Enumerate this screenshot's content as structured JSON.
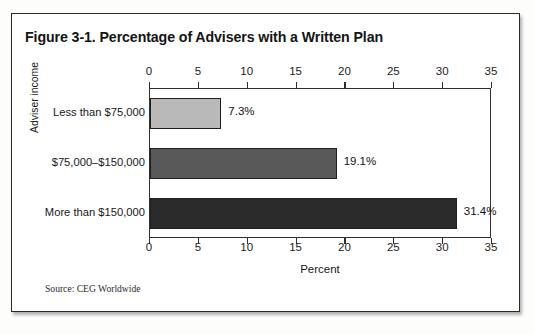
{
  "figure": {
    "title": "Figure 3-1. Percentage of Advisers with a Written Plan",
    "source": "Source: CEG Worldwide"
  },
  "chart_data": {
    "type": "bar",
    "orientation": "horizontal",
    "title": "Figure 3-1. Percentage of Advisers with a Written Plan",
    "categories": [
      "Less than $75,000",
      "$75,000–$150,000",
      "More than $150,000"
    ],
    "values": [
      7.3,
      19.1,
      31.4
    ],
    "value_labels": [
      "7.3%",
      "19.1%",
      "31.4%"
    ],
    "bar_colors": [
      "#b9b9b9",
      "#595959",
      "#2b2b2b"
    ],
    "xlabel": "Percent",
    "ylabel": "Adviser income",
    "xlim": [
      0,
      35
    ],
    "xticks": [
      0,
      5,
      10,
      15,
      20,
      25,
      30,
      35
    ],
    "xtick_labels": [
      "0",
      "5",
      "10",
      "15",
      "20",
      "25",
      "30",
      "35"
    ],
    "top_axis": true,
    "bottom_axis": true,
    "grid": false,
    "legend": "none"
  }
}
